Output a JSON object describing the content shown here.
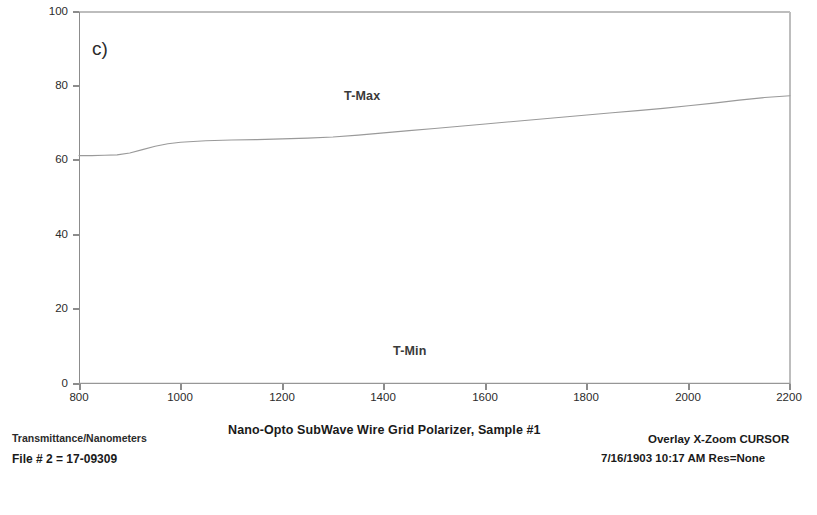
{
  "panel": {
    "label": "c)"
  },
  "footer": {
    "title": "Nano-Opto SubWave Wire Grid Polarizer, Sample #1",
    "axis_caption": "Transmittance/Nanometers",
    "file_line": "File # 2 = 17-09309",
    "overlay_mode": "Overlay X-Zoom CURSOR",
    "timestamp_line": "7/16/1903  10:17 AM  Res=None"
  },
  "chart_data": {
    "type": "line",
    "title": "Nano-Opto SubWave Wire Grid Polarizer, Sample #1",
    "xlabel": "Nanometers",
    "ylabel": "Transmittance",
    "xlim": [
      800,
      2200
    ],
    "ylim": [
      0,
      100
    ],
    "xticks": [
      800,
      1000,
      1200,
      1400,
      1600,
      1800,
      2000,
      2200
    ],
    "yticks": [
      0,
      20,
      40,
      60,
      80,
      100
    ],
    "grid": false,
    "legend": "inline-annotations",
    "line_color": "#9a9a9a",
    "series": [
      {
        "name": "T-Max",
        "label_position": {
          "x": 1280,
          "y": 82
        },
        "x": [
          800,
          825,
          850,
          875,
          900,
          925,
          950,
          975,
          1000,
          1050,
          1100,
          1150,
          1200,
          1250,
          1300,
          1350,
          1400,
          1450,
          1500,
          1550,
          1600,
          1650,
          1700,
          1750,
          1800,
          1850,
          1900,
          1950,
          2000,
          2050,
          2100,
          2150,
          2200
        ],
        "values": [
          61.4,
          61.4,
          61.5,
          61.6,
          62.1,
          63.0,
          63.9,
          64.6,
          65.0,
          65.4,
          65.6,
          65.7,
          65.9,
          66.1,
          66.4,
          66.9,
          67.5,
          68.1,
          68.7,
          69.3,
          69.9,
          70.5,
          71.1,
          71.7,
          72.3,
          72.9,
          73.5,
          74.1,
          74.8,
          75.5,
          76.3,
          77.0,
          77.5
        ]
      },
      {
        "name": "T-Min",
        "label_position": {
          "x": 1420,
          "y": 11
        },
        "x": [
          800,
          1000,
          1200,
          1400,
          1600,
          1800,
          2000,
          2200
        ],
        "values": [
          0.2,
          0.2,
          0.2,
          0.2,
          0.2,
          0.2,
          0.2,
          0.2
        ]
      }
    ]
  }
}
